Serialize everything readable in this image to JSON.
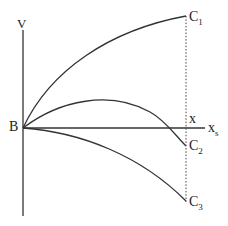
{
  "diagram": {
    "axis_labels": {
      "vertical": "V",
      "origin": "B",
      "x_marker": "x",
      "x_end_main": "x",
      "x_end_sub": "s"
    },
    "curves": [
      {
        "name": "C",
        "sub": "1",
        "shape": "rising concave"
      },
      {
        "name": "C",
        "sub": "2",
        "shape": "rise then fall"
      },
      {
        "name": "C",
        "sub": "3",
        "shape": "falling"
      }
    ],
    "colors": {
      "stroke": "#333333",
      "background": "#ffffff"
    }
  }
}
